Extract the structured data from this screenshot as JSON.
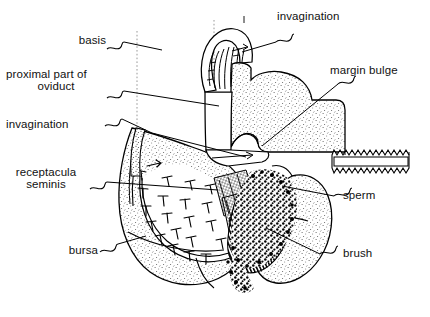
{
  "figure": {
    "kind": "anatomical-line-drawing",
    "style": "black ink line drawing on white, stippled shading",
    "width": 430,
    "height": 317,
    "ink": "#000000",
    "background": "#ffffff",
    "stipple": "#555555"
  },
  "labels": {
    "basis": "basis",
    "proximal_oviduct_line1": "proximal part of",
    "proximal_oviduct_line2": "oviduct",
    "invagination_left": "invagination",
    "receptacula_line1": "receptacula",
    "receptacula_line2": "seminis",
    "bursa": "bursa",
    "invagination_top": "invagination",
    "margin_bulge": "margin bulge",
    "sperm": "sperm",
    "brush": "brush"
  },
  "caption": {
    "text": ""
  },
  "structures": [
    {
      "name": "basis",
      "side": "left",
      "description": "dorsal base of the genital segment, indicated by a horizontal leader crossing the midline axis"
    },
    {
      "name": "proximal part of oviduct",
      "side": "left",
      "description": "narrow tube running down the midline from the basis"
    },
    {
      "name": "invagination",
      "side": "left",
      "description": "infolding on the left margin of the bursa"
    },
    {
      "name": "receptacula seminis",
      "side": "left",
      "description": "arc of nail-shaped spermathecae lining the inner wall of the bursa"
    },
    {
      "name": "bursa",
      "side": "left",
      "description": "large stippled copulatory pouch forming the lower left lobe"
    },
    {
      "name": "invagination",
      "side": "top-right",
      "description": "ribbed hood-like infolding at the top of the organ"
    },
    {
      "name": "margin bulge",
      "side": "right",
      "description": "swelling along the right margin, drawn with a zig-zag banded edge"
    },
    {
      "name": "sperm",
      "side": "right",
      "description": "dense stippled mass of spermatozoa in the centre"
    },
    {
      "name": "brush",
      "side": "right",
      "description": "striated brush of fibres beneath the sperm mass"
    }
  ]
}
